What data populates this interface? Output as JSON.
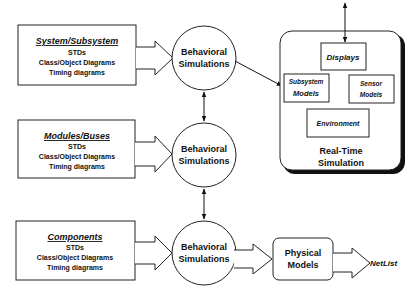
{
  "diagram": {
    "source_boxes": [
      {
        "title": "System/Subsystem",
        "lines": [
          "STDs",
          "Class/Object Diagrams",
          "Timing diagrams"
        ]
      },
      {
        "title": "Modules/Buses",
        "lines": [
          "STDs",
          "Class/Object Diagrams",
          "Timing diagrams"
        ]
      },
      {
        "title": "Components",
        "lines": [
          "STDs",
          "Class/Object Diagrams",
          "Timing diagrams"
        ]
      }
    ],
    "simulations": [
      {
        "line1": "Behavioral",
        "line2": "Simulations"
      },
      {
        "line1": "Behavioral",
        "line2": "Simulations"
      },
      {
        "line1": "Behavioral",
        "line2": "Simulations"
      }
    ],
    "real_time": {
      "title1": "Real-Time",
      "title2": "Simulation",
      "displays": "Displays",
      "subsystem_models": {
        "line1": "Subsystem",
        "line2": "Models"
      },
      "sensor_models": {
        "line1": "Sensor",
        "line2": "Models"
      },
      "environment": "Environment"
    },
    "physical_models": {
      "line1": "Physical",
      "line2": "Models"
    },
    "netlist": "NetList"
  }
}
